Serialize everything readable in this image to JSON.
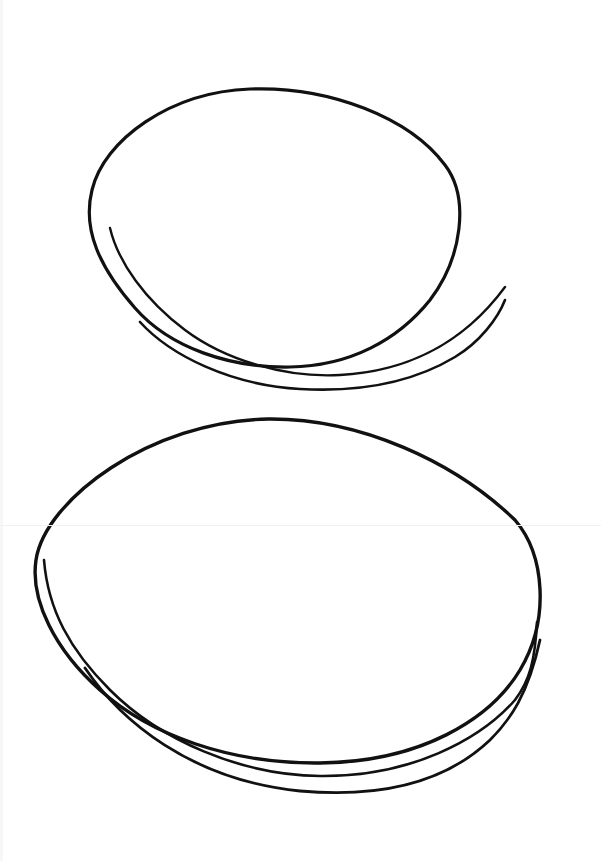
{
  "illustration": {
    "subject": "two plates",
    "style": "black line drawing on white",
    "colors": {
      "background": "#ffffff",
      "ink": "#111111"
    },
    "plates": [
      {
        "name": "top-plate"
      },
      {
        "name": "bottom-plate"
      }
    ]
  }
}
